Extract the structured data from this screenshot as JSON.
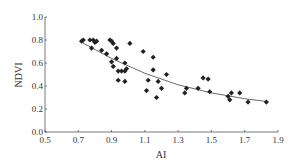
{
  "chart_data": {
    "type": "scatter",
    "title": "",
    "xlabel": "AI",
    "ylabel": "NDVI",
    "xlim": [
      0.5,
      1.9
    ],
    "ylim": [
      0.0,
      1.0
    ],
    "xticks": [
      "0.5",
      "0.7",
      "0.9",
      "1.1",
      "1.3",
      "1.5",
      "1.7",
      "1.9"
    ],
    "yticks": [
      "0.0",
      "0.2",
      "0.4",
      "0.6",
      "0.8",
      "1.0"
    ],
    "grid": false,
    "legend": null,
    "marker": "diamond",
    "color": "#222222",
    "points": [
      [
        0.72,
        0.79
      ],
      [
        0.73,
        0.8
      ],
      [
        0.77,
        0.8
      ],
      [
        0.79,
        0.8
      ],
      [
        0.8,
        0.78
      ],
      [
        0.81,
        0.79
      ],
      [
        0.78,
        0.73
      ],
      [
        0.84,
        0.71
      ],
      [
        0.87,
        0.68
      ],
      [
        0.89,
        0.8
      ],
      [
        0.9,
        0.79
      ],
      [
        0.91,
        0.77
      ],
      [
        0.93,
        0.73
      ],
      [
        0.9,
        0.61
      ],
      [
        0.91,
        0.57
      ],
      [
        0.93,
        0.64
      ],
      [
        0.94,
        0.53
      ],
      [
        0.96,
        0.53
      ],
      [
        0.98,
        0.53
      ],
      [
        0.98,
        0.6
      ],
      [
        0.99,
        0.55
      ],
      [
        0.94,
        0.45
      ],
      [
        0.98,
        0.44
      ],
      [
        1.01,
        0.77
      ],
      [
        1.09,
        0.7
      ],
      [
        1.11,
        0.36
      ],
      [
        1.12,
        0.45
      ],
      [
        1.15,
        0.65
      ],
      [
        1.15,
        0.54
      ],
      [
        1.23,
        0.5
      ],
      [
        1.18,
        0.44
      ],
      [
        1.2,
        0.38
      ],
      [
        1.17,
        0.3
      ],
      [
        1.34,
        0.34
      ],
      [
        1.35,
        0.38
      ],
      [
        1.42,
        0.38
      ],
      [
        1.45,
        0.47
      ],
      [
        1.48,
        0.46
      ],
      [
        1.49,
        0.35
      ],
      [
        1.6,
        0.31
      ],
      [
        1.61,
        0.28
      ],
      [
        1.62,
        0.34
      ],
      [
        1.67,
        0.34
      ],
      [
        1.72,
        0.26
      ],
      [
        1.83,
        0.26
      ]
    ],
    "trendline": {
      "type": "curve",
      "x": [
        0.72,
        0.9,
        1.1,
        1.3,
        1.5,
        1.7,
        1.83
      ],
      "y": [
        0.78,
        0.64,
        0.51,
        0.41,
        0.34,
        0.29,
        0.265
      ]
    }
  }
}
